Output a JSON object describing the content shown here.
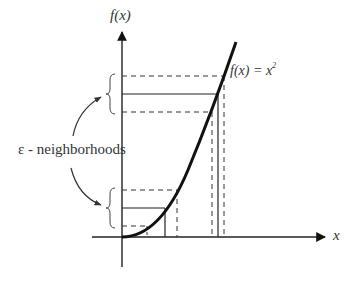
{
  "diagram": {
    "y_axis_label": "f(x)",
    "x_axis_label": "x",
    "function_label": "f(x) = x",
    "function_exponent": "2",
    "annotation_label": "ε - neighborhoods",
    "colors": {
      "background": "#ffffff",
      "ink": "#111111",
      "text": "#333333"
    },
    "neighborhoods": [
      {
        "name": "upper",
        "y_value_line": 94,
        "y_band": [
          76,
          112
        ],
        "x_value_line": 218,
        "x_band": [
          212,
          224
        ]
      },
      {
        "name": "lower",
        "y_value_line": 208,
        "y_band": [
          190,
          226
        ],
        "x_value_line": 165,
        "x_band": [
          147,
          177
        ]
      }
    ]
  }
}
